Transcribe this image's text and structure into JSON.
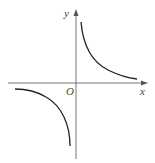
{
  "figure": {
    "type": "function-graph",
    "axes": {
      "x_label": "x",
      "y_label": "y",
      "origin_label": "O"
    },
    "branches": [
      {
        "name": "first-quadrant-branch",
        "quadrant": 1
      },
      {
        "name": "third-quadrant-branch",
        "quadrant": 3
      }
    ],
    "colors": {
      "axis": "#777777",
      "curve": "#222222",
      "label": "#444444",
      "background": "#ffffff"
    }
  }
}
